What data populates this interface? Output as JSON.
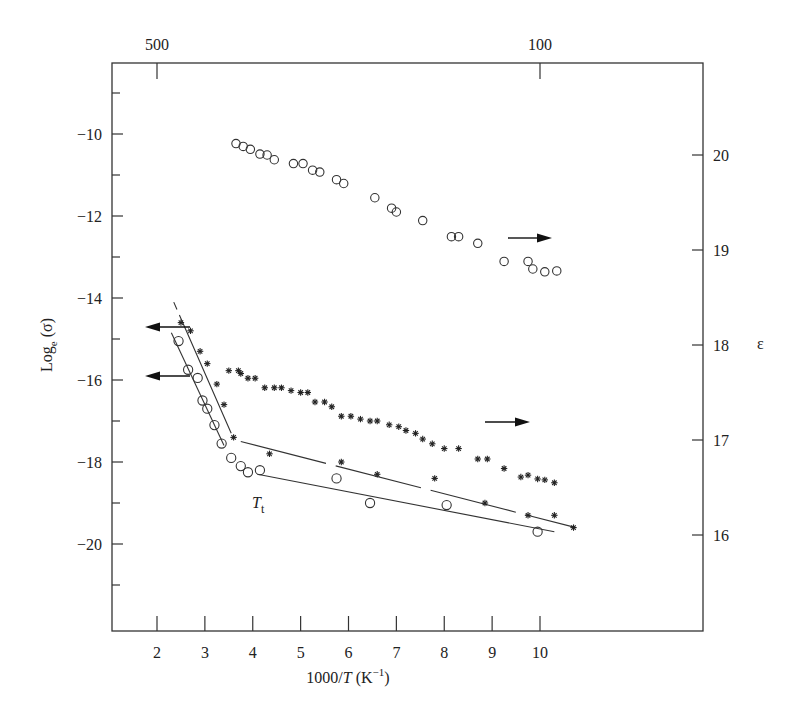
{
  "chart_data": {
    "type": "scatter",
    "title": "",
    "xlabel": "1000/T (K⁻¹)",
    "ylabel_left": "Log_e (σ)",
    "ylabel_right": "ε",
    "x_ticks": [
      2,
      3,
      4,
      5,
      6,
      7,
      8,
      9,
      10
    ],
    "x_tick_labels": [
      "2",
      "3",
      "4",
      "5",
      "6",
      "7",
      "8",
      "9",
      "10"
    ],
    "xlim": [
      1.05,
      10.9
    ],
    "y_left_ticks": [
      -10,
      -12,
      -14,
      -16,
      -18,
      -20
    ],
    "y_left_tick_labels": [
      "−10",
      "−12",
      "−14",
      "−16",
      "−18",
      "−20"
    ],
    "y_left_minor_ticks": [
      -9,
      -11,
      -13,
      -15,
      -17,
      -19,
      -21
    ],
    "ylim_left": [
      -22.2,
      -8.4
    ],
    "y_right_ticks": [
      20,
      19,
      18,
      17,
      16
    ],
    "y_right_tick_labels": [
      "20",
      "19",
      "18",
      "17",
      "16"
    ],
    "ylim_right": [
      15.0,
      21.0
    ],
    "top_axis": {
      "label": "Temperature (K)",
      "ticks": [
        {
          "label": "500",
          "x": 2.0
        },
        {
          "label": "100",
          "x": 10.0
        }
      ]
    },
    "annotation": {
      "text": "T",
      "subscript": "t",
      "x": 3.55,
      "y": -18.6
    },
    "series": [
      {
        "name": "epsilon_circles",
        "marker": "circle",
        "axis": "right",
        "arrow": "right",
        "x": [
          3.65,
          3.8,
          3.95,
          4.15,
          4.3,
          4.45,
          4.85,
          5.05,
          5.25,
          5.4,
          5.75,
          5.9,
          6.55,
          6.9,
          7.0,
          7.55,
          8.15,
          8.3,
          8.7,
          9.25,
          9.75,
          9.85,
          10.1,
          10.35
        ],
        "y": [
          20.12,
          20.09,
          20.06,
          20.01,
          20.0,
          19.95,
          19.91,
          19.91,
          19.84,
          19.82,
          19.74,
          19.7,
          19.55,
          19.44,
          19.4,
          19.31,
          19.14,
          19.14,
          19.07,
          18.88,
          18.88,
          18.8,
          18.77,
          18.78
        ]
      },
      {
        "name": "epsilon_stars",
        "marker": "star",
        "axis": "right",
        "arrow": "right",
        "x": [
          3.5,
          3.7,
          3.75,
          3.9,
          4.05,
          4.25,
          4.45,
          4.6,
          4.8,
          5.0,
          5.15,
          5.3,
          5.5,
          5.65,
          5.85,
          6.05,
          6.25,
          6.45,
          6.6,
          6.85,
          7.05,
          7.2,
          7.4,
          7.55,
          7.75,
          8.0,
          8.3,
          8.7,
          8.9,
          9.25,
          9.6,
          9.75,
          9.95,
          10.1,
          10.3
        ],
        "y": [
          17.73,
          17.73,
          17.7,
          17.65,
          17.65,
          17.55,
          17.55,
          17.55,
          17.52,
          17.5,
          17.5,
          17.4,
          17.4,
          17.35,
          17.25,
          17.25,
          17.22,
          17.2,
          17.2,
          17.16,
          17.14,
          17.1,
          17.07,
          17.01,
          16.96,
          16.91,
          16.91,
          16.8,
          16.8,
          16.7,
          16.61,
          16.63,
          16.59,
          16.58,
          16.55
        ]
      },
      {
        "name": "sigma_stars",
        "marker": "star",
        "axis": "left",
        "arrow": "left",
        "x": [
          2.5,
          2.7,
          2.9,
          3.05,
          3.25,
          3.4,
          3.6,
          4.35,
          5.85,
          6.6,
          7.8,
          8.85,
          9.75,
          10.3,
          10.7
        ],
        "y": [
          -14.6,
          -14.8,
          -15.3,
          -15.6,
          -16.1,
          -16.6,
          -17.4,
          -17.8,
          -18.0,
          -18.3,
          -18.4,
          -19.0,
          -19.3,
          -19.3,
          -19.6
        ]
      },
      {
        "name": "sigma_circles",
        "marker": "circle",
        "axis": "left",
        "arrow": "left",
        "x": [
          2.45,
          2.65,
          2.85,
          2.95,
          3.05,
          3.2,
          3.35,
          3.55,
          3.75,
          3.9,
          4.15,
          5.75,
          6.45,
          8.05,
          9.95
        ],
        "y": [
          -15.05,
          -15.75,
          -15.95,
          -16.5,
          -16.7,
          -17.1,
          -17.55,
          -17.9,
          -18.1,
          -18.25,
          -18.2,
          -18.4,
          -19.0,
          -19.05,
          -19.7
        ]
      }
    ],
    "fit_lines": [
      {
        "name": "sigma_stars_high_T",
        "style": "solid_dashed_top",
        "x": [
          2.35,
          3.55
        ],
        "y": [
          -14.1,
          -17.3
        ]
      },
      {
        "name": "sigma_circles_high_T",
        "style": "solid",
        "x": [
          2.3,
          3.4
        ],
        "y": [
          -14.85,
          -17.6
        ]
      },
      {
        "name": "sigma_stars_low_T",
        "style": "long-dash",
        "x": [
          3.75,
          10.75
        ],
        "y": [
          -17.5,
          -19.6
        ]
      },
      {
        "name": "sigma_circles_low_T",
        "style": "solid",
        "x": [
          4.1,
          10.3
        ],
        "y": [
          -18.3,
          -19.7
        ]
      }
    ],
    "grid": false,
    "legend": "none (arrows indicate axis)"
  }
}
